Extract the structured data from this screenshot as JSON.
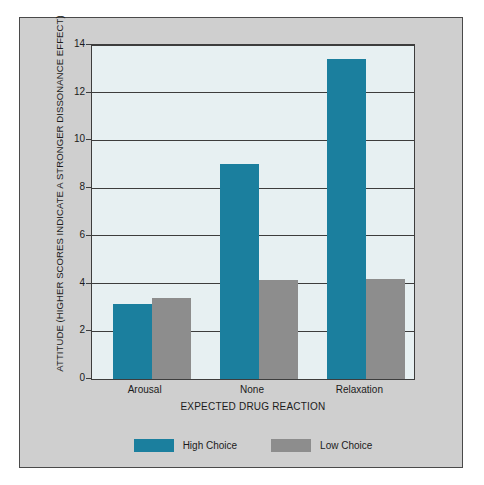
{
  "chart_data": {
    "type": "bar",
    "title": "",
    "categories": [
      "Arousal",
      "None",
      "Relaxation"
    ],
    "series": [
      {
        "name": "High Choice",
        "color": "#1b7f9e",
        "values": [
          3.15,
          9.0,
          13.4
        ]
      },
      {
        "name": "Low Choice",
        "color": "#8d8d8d",
        "values": [
          3.4,
          4.15,
          4.2
        ]
      }
    ],
    "xlabel": "EXPECTED DRUG REACTION",
    "ylabel": "ATTITUDE (HIGHER SCORES INDICATE A STRONGER DISSONANCE EFFECT)",
    "ylim": [
      0,
      14
    ],
    "yticks": [
      0,
      2,
      4,
      6,
      8,
      10,
      12,
      14
    ],
    "ytick_labels": [
      "0",
      "2",
      "4",
      "6",
      "8",
      "10",
      "12",
      "14"
    ],
    "grid": true,
    "legend_position": "bottom",
    "legend": [
      "High Choice",
      "Low Choice"
    ],
    "plot_background": "#e7f0f2",
    "figure_background": "#cfcfcf",
    "axis_color": "#3d3d3d"
  }
}
